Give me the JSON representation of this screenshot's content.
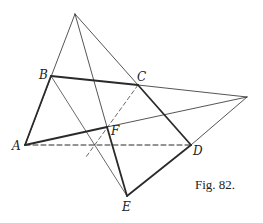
{
  "figure": {
    "caption": "Fig. 82.",
    "points": {
      "O": {
        "x": 75,
        "y": 14,
        "label": ""
      },
      "A": {
        "x": 25,
        "y": 145,
        "label": "A"
      },
      "B": {
        "x": 51,
        "y": 76,
        "label": "B"
      },
      "C": {
        "x": 138,
        "y": 85,
        "label": "C"
      },
      "D": {
        "x": 191,
        "y": 145,
        "label": "D"
      },
      "E": {
        "x": 127,
        "y": 196,
        "label": "E"
      },
      "F": {
        "x": 107,
        "y": 127,
        "label": "F"
      },
      "P": {
        "x": 247,
        "y": 97,
        "label": ""
      }
    },
    "colors": {
      "stroke": "#2a2a2a",
      "background": "#ffffff"
    }
  }
}
